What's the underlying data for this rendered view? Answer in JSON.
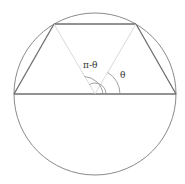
{
  "diagram": {
    "circle": {
      "cx": 95,
      "cy": 94,
      "r": 81,
      "stroke": "#8a8a8a"
    },
    "trapezoid": {
      "vertices": [
        [
          14,
          94
        ],
        [
          54,
          24
        ],
        [
          136,
          24
        ],
        [
          176,
          94
        ]
      ],
      "stroke": "#6e6e6e"
    },
    "radii": [
      {
        "from": [
          95,
          94
        ],
        "to": [
          54,
          24
        ]
      },
      {
        "from": [
          95,
          94
        ],
        "to": [
          136,
          24
        ]
      }
    ],
    "radii_color": "#c8c8c8",
    "angles": [
      {
        "label": "π-θ",
        "x": 83,
        "y": 68
      },
      {
        "label": "θ",
        "x": 120,
        "y": 78
      }
    ]
  }
}
